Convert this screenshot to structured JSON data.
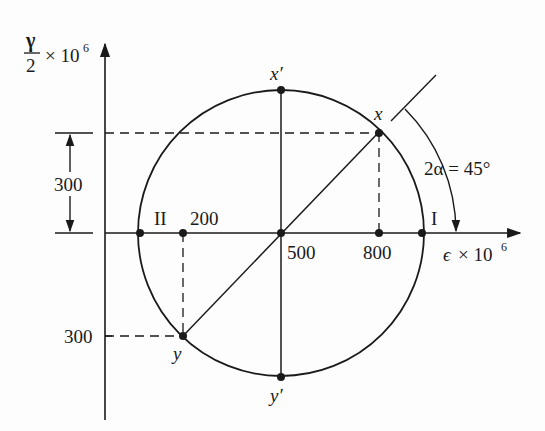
{
  "diagram": {
    "colors": {
      "ink": "#1a1a1a",
      "background": "#fdfdfd"
    },
    "axes": {
      "vertical_label": {
        "numerator": "γ",
        "denominator": "2",
        "suffix": "× 10",
        "exp": "6"
      },
      "horizontal_label": {
        "symbol": "ϵ",
        "suffix": "× 10",
        "exp": "6"
      }
    },
    "points": {
      "x": "x",
      "x_prime": "x′",
      "y": "y",
      "y_prime": "y′",
      "principal_1": "I",
      "principal_2": "II"
    },
    "tick_labels": {
      "eps_200": "200",
      "eps_500": "500",
      "eps_800": "800",
      "gamma_300_lower": "300",
      "gamma_300_dim": "300"
    },
    "angle_label": "2α = 45°",
    "values": {
      "center_eps": 500,
      "x_point": {
        "eps": 800,
        "gamma_half": 300
      },
      "y_point": {
        "eps": 200,
        "gamma_half": -300
      },
      "two_alpha_deg": 45
    }
  }
}
